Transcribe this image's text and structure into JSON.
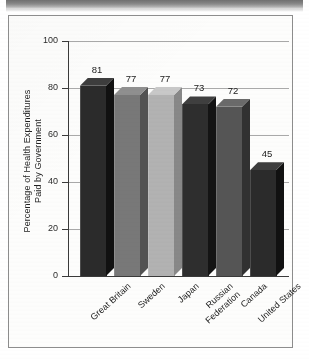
{
  "figure": {
    "background_color": "#fdfdfc",
    "border_color": "#8d8d8d",
    "top_band_color": "#7a7a7a"
  },
  "chart_data": {
    "type": "bar",
    "title": "",
    "xlabel": "",
    "ylabel": "Percentage of Health Expenditures Paid by Government",
    "ylabel_line1": "Percentage of Health Expenditures",
    "ylabel_line2": "Paid by Government",
    "categories": [
      "Great Britain",
      "Sweden",
      "Japan",
      "Russian Federation",
      "Canada",
      "United States"
    ],
    "values": [
      81,
      77,
      77,
      73,
      72,
      45
    ],
    "value_labels": [
      "81",
      "77",
      "77",
      "73",
      "72",
      "45"
    ],
    "ylim": [
      0,
      100
    ],
    "ytick_labels": [
      "0",
      "20",
      "40",
      "60",
      "80",
      "100"
    ],
    "ytick_values": [
      0,
      20,
      40,
      60,
      80,
      100
    ],
    "grid": true,
    "legend": "none",
    "bar_colors": [
      "#2b2b2b",
      "#787878",
      "#b2b2b2",
      "#2e2e2e",
      "#555555",
      "#2b2b2b"
    ],
    "bar_side_colors": [
      "#111111",
      "#525252",
      "#888888",
      "#141414",
      "#313131",
      "#111111"
    ],
    "bar_top_colors": [
      "#3d3d3d",
      "#8f8f8f",
      "#c8c8c8",
      "#3f3f3f",
      "#6a6a6a",
      "#3d3d3d"
    ],
    "axis_color": "#3a3a3a",
    "grid_color": "#a9a9a9"
  }
}
